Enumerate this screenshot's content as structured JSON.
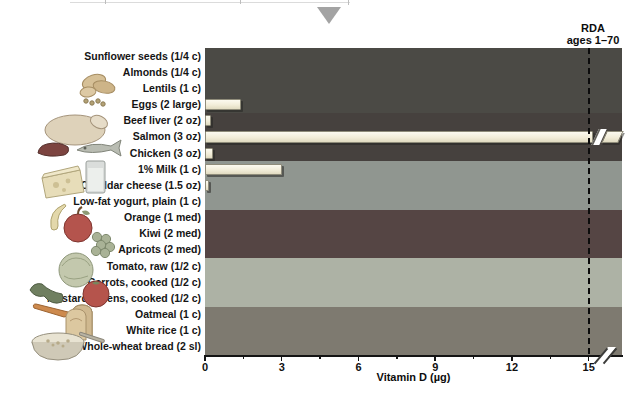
{
  "chart_data": {
    "type": "bar",
    "title": "",
    "xlabel": "Vitamin D (µg)",
    "x_ticks": [
      0,
      3,
      6,
      9,
      12,
      15
    ],
    "x_minor_ticks": [
      1.5,
      4.5,
      7.5,
      10.5,
      13.5
    ],
    "xlim": [
      0,
      16.3
    ],
    "grid": false,
    "bar_color": "#f2edd9",
    "rda": {
      "value": 15,
      "label_line1": "RDA",
      "label_line2": "ages 1–70"
    },
    "groups": [
      {
        "name": "legumes-nuts-seeds",
        "band_color": "#4b4a45",
        "items": [
          {
            "label": "Sunflower seeds (1/4 c)",
            "value": 0
          },
          {
            "label": "Almonds (1/4 c)",
            "value": 0
          },
          {
            "label": "Lentils (1 c)",
            "value": 0
          },
          {
            "label": "Eggs (2 large)",
            "value": 1.4
          }
        ]
      },
      {
        "name": "meat-fish-poultry",
        "band_color": "#46413e",
        "items": [
          {
            "label": "Beef liver (2 oz)",
            "value": 0.25
          },
          {
            "label": "Salmon (3 oz)",
            "value": 16.5,
            "off_scale": true,
            "display": ">15"
          },
          {
            "label": "Chicken (3 oz)",
            "value": 0.3
          }
        ]
      },
      {
        "name": "dairy",
        "band_color": "#909690",
        "items": [
          {
            "label": "1% Milk (1 c)",
            "value": 3.0
          },
          {
            "label": "Cheddar cheese (1.5 oz)",
            "value": 0.15
          },
          {
            "label": "Low-fat yogurt, plain (1 c)",
            "value": 0
          }
        ]
      },
      {
        "name": "fruits",
        "band_color": "#554544",
        "items": [
          {
            "label": "Orange (1 med)",
            "value": 0
          },
          {
            "label": "Kiwi (2 med)",
            "value": 0
          },
          {
            "label": "Apricots (2 med)",
            "value": 0
          }
        ]
      },
      {
        "name": "vegetables",
        "band_color": "#adb2a5",
        "items": [
          {
            "label": "Tomato, raw (1/2 c)",
            "value": 0
          },
          {
            "label": "Carrots, cooked (1/2 c)",
            "value": 0
          },
          {
            "label": "Mustard greens, cooked (1/2 c)",
            "value": 0
          }
        ]
      },
      {
        "name": "grains",
        "band_color": "#7e7a70",
        "items": [
          {
            "label": "Oatmeal (1 c)",
            "value": 0
          },
          {
            "label": "White rice (1 c)",
            "value": 0
          },
          {
            "label": "Whole-wheat bread (2 sl)",
            "value": 0
          }
        ]
      }
    ]
  },
  "icons": {
    "pointer": "triangle-down-icon",
    "group_markers": [
      "nuts-seeds-icon",
      "meat-fish-poultry-icon",
      "dairy-icon",
      "fruit-icon",
      "vegetables-icon",
      "grains-icon"
    ]
  },
  "colors": {
    "pointer_triangle": "#a3a3a3",
    "axis_text": "#0d0d0d",
    "rda_dash": "#0c0c0c"
  }
}
